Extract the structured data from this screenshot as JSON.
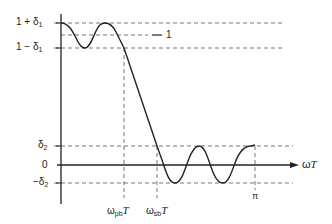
{
  "diagram": {
    "type": "lowpass-filter-tolerance-scheme",
    "x_axis": {
      "label": "ωT",
      "ticks": {
        "passband_edge": "ω_pb T",
        "stopband_edge": "ω_sb T",
        "nyquist": "π"
      }
    },
    "y_axis": {
      "ticks": {
        "upper_passband": "1 + δ1",
        "unity": "1",
        "lower_passband": "1 − δ1",
        "upper_stopband": "δ2",
        "zero": "0",
        "lower_stopband": "−δ2"
      }
    }
  },
  "labels": {
    "y_upper_pre": "1 + δ",
    "y_upper_sub": "1",
    "y_unity": "1",
    "y_lower_pre": "1 − δ",
    "y_lower_sub": "1",
    "y_delta2_pre": "δ",
    "y_delta2_sub": "2",
    "y_zero": "0",
    "y_negdelta2_pre": "−δ",
    "y_negdelta2_sub": "2",
    "x_pb_omega": "ω",
    "x_pb_sub": "pb",
    "x_pb_T": "T",
    "x_sb_omega": "ω",
    "x_sb_sub": "sb",
    "x_sb_T": "T",
    "x_pi": "π",
    "x_axis_omega": "ω",
    "x_axis_T": "T"
  },
  "colors": {
    "ink": "#222222",
    "dash": "#555555",
    "background": "#ffffff"
  }
}
